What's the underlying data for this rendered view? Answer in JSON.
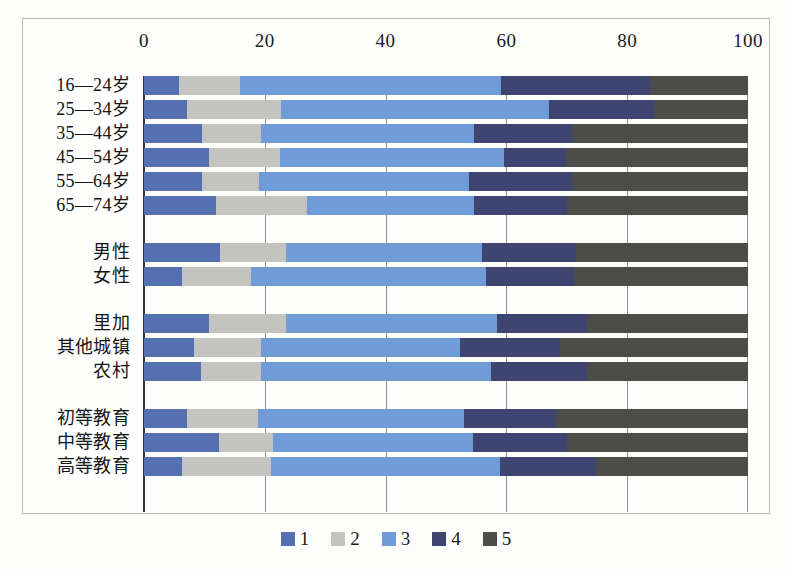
{
  "chart_data": {
    "type": "bar",
    "orientation": "horizontal",
    "stacked": true,
    "stacked_100": true,
    "title": "",
    "xlabel": "",
    "ylabel": "",
    "xlim": [
      0,
      100
    ],
    "xticks": [
      0,
      20,
      40,
      60,
      80,
      100
    ],
    "grid": true,
    "legend_position": "bottom",
    "series": [
      {
        "name": "1",
        "color": "#5570b0"
      },
      {
        "name": "2",
        "color": "#c3c3bf"
      },
      {
        "name": "3",
        "color": "#6f9bd8"
      },
      {
        "name": "4",
        "color": "#3d4570"
      },
      {
        "name": "5",
        "color": "#4c4c4a"
      }
    ],
    "groups": [
      {
        "name": "age",
        "categories": [
          "16—24岁",
          "25—34岁",
          "35—44岁",
          "45—54岁",
          "55—64岁",
          "65—74岁"
        ],
        "values": [
          [
            5.8,
            10.1,
            43.2,
            24.6,
            16.3
          ],
          [
            7.2,
            15.4,
            44.4,
            17.5,
            15.5
          ],
          [
            9.6,
            9.7,
            35.3,
            16.3,
            29.1
          ],
          [
            10.8,
            11.8,
            37.0,
            10.2,
            30.2
          ],
          [
            9.6,
            9.4,
            34.8,
            17.1,
            29.1
          ],
          [
            11.9,
            15.1,
            27.6,
            15.5,
            29.9
          ]
        ]
      },
      {
        "name": "gender",
        "categories": [
          "男性",
          "女性"
        ],
        "values": [
          [
            12.6,
            10.9,
            32.5,
            15.5,
            28.5
          ],
          [
            6.3,
            11.4,
            38.9,
            14.6,
            28.8
          ]
        ]
      },
      {
        "name": "location",
        "categories": [
          "里加",
          "其他城镇",
          "农村"
        ],
        "values": [
          [
            10.8,
            12.7,
            35.0,
            14.9,
            26.6
          ],
          [
            8.3,
            11.0,
            33.1,
            16.5,
            31.1
          ],
          [
            9.4,
            9.9,
            38.1,
            16.0,
            26.6
          ]
        ]
      },
      {
        "name": "education",
        "categories": [
          "初等教育",
          "中等教育",
          "高等教育"
        ],
        "values": [
          [
            7.2,
            11.6,
            34.2,
            15.2,
            31.8
          ],
          [
            12.4,
            8.9,
            33.1,
            15.7,
            29.9
          ],
          [
            6.3,
            14.7,
            38.0,
            15.8,
            25.2
          ]
        ]
      }
    ]
  },
  "axis": {
    "ticks": [
      {
        "label": "0",
        "value": 0
      },
      {
        "label": "20",
        "value": 20
      },
      {
        "label": "40",
        "value": 40
      },
      {
        "label": "60",
        "value": 60
      },
      {
        "label": "80",
        "value": 80
      },
      {
        "label": "100",
        "value": 100
      }
    ]
  },
  "legend": {
    "items": [
      {
        "label": "1",
        "color": "#5570b0"
      },
      {
        "label": "2",
        "color": "#c3c3bf"
      },
      {
        "label": "3",
        "color": "#6f9bd8"
      },
      {
        "label": "4",
        "color": "#3d4570"
      },
      {
        "label": "5",
        "color": "#4c4c4a"
      }
    ]
  }
}
